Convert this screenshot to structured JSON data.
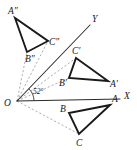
{
  "figure": {
    "background_color": "#ffffff",
    "stroke_color": "#1a1a1a",
    "construction_color": "#9a9a9a",
    "width": 137,
    "height": 150
  },
  "axes": {
    "origin": {
      "label": "O",
      "x": 17,
      "y": 101,
      "label_x": 4,
      "label_y": 106
    },
    "x_axis": {
      "label": "X",
      "from_x": 17,
      "from_y": 101,
      "to_x": 120,
      "to_y": 99,
      "label_x": 124,
      "label_y": 99
    },
    "y_axis": {
      "label": "Y",
      "from_x": 17,
      "from_y": 101,
      "to_x": 90,
      "to_y": 25,
      "label_x": 92,
      "label_y": 22
    }
  },
  "angle": {
    "value": "52",
    "degree_symbol": "°",
    "text": "52°",
    "label_x": 33,
    "label_y": 94,
    "arc_radius": 17
  },
  "triangles": [
    {
      "name": "triangle-abc",
      "id": "original",
      "vertices": [
        {
          "label": "A",
          "x": 110,
          "y": 105,
          "label_x": 112,
          "label_y": 102
        },
        {
          "label": "B",
          "x": 69,
          "y": 113,
          "label_x": 60,
          "label_y": 112
        },
        {
          "label": "C",
          "x": 79,
          "y": 134,
          "label_x": 76,
          "label_y": 146
        }
      ]
    },
    {
      "name": "triangle-a-prime-b-prime-c-prime",
      "id": "first-rotation",
      "vertices": [
        {
          "label": "A′",
          "x": 108,
          "y": 81,
          "label_x": 110,
          "label_y": 87
        },
        {
          "label": "B′",
          "x": 69,
          "y": 78,
          "label_x": 59,
          "label_y": 86
        },
        {
          "label": "C′",
          "x": 76,
          "y": 58,
          "label_x": 72,
          "label_y": 54
        }
      ]
    },
    {
      "name": "triangle-a-double-prime-b-double-prime-c-double-prime",
      "id": "second-rotation",
      "vertices": [
        {
          "label": "A″",
          "x": 15,
          "y": 18,
          "label_x": 8,
          "label_y": 14
        },
        {
          "label": "B″",
          "x": 27,
          "y": 52,
          "label_x": 25,
          "label_y": 62
        },
        {
          "label": "C″",
          "x": 48,
          "y": 41,
          "label_x": 49,
          "label_y": 45
        }
      ]
    }
  ],
  "construction_lines": [
    {
      "name": "o-to-c",
      "x1": 17,
      "y1": 101,
      "x2": 79,
      "y2": 134
    },
    {
      "name": "o-to-b-prime",
      "x1": 17,
      "y1": 101,
      "x2": 69,
      "y2": 78
    },
    {
      "name": "o-to-c-prime",
      "x1": 17,
      "y1": 101,
      "x2": 76,
      "y2": 58
    },
    {
      "name": "o-to-b-double-prime",
      "x1": 17,
      "y1": 101,
      "x2": 27,
      "y2": 52
    },
    {
      "name": "o-to-c-double-prime",
      "x1": 17,
      "y1": 101,
      "x2": 48,
      "y2": 41
    }
  ]
}
